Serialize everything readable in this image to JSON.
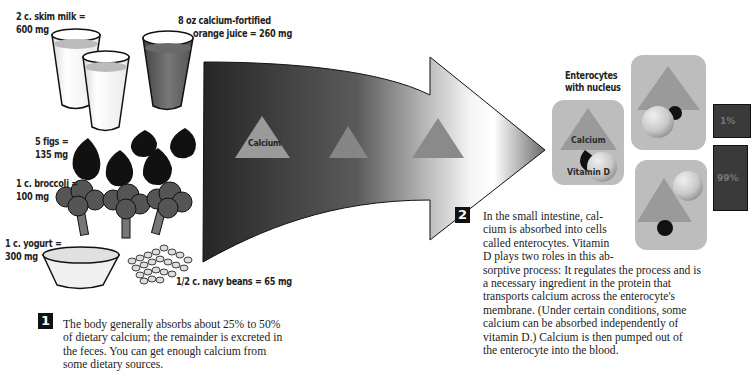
{
  "sources": {
    "milk": "2 c. skim milk =",
    "milk_mg": "600 mg",
    "oj_line1": "8 oz calcium-fortified",
    "oj_line2": "orange juice = 260 mg",
    "figs": "5 figs =",
    "figs_mg": "135 mg",
    "broccoli": "1 c. broccoli =",
    "broccoli_mg": "100 mg",
    "yogurt": "1 c. yogurt =",
    "yogurt_mg": "300 mg",
    "beans": "1/2 c. navy beans = 65 mg"
  },
  "arrow": {
    "calcium_label": "Calcium"
  },
  "enterocytes": {
    "title_line1": "Enterocytes",
    "title_line2": "with nucleus",
    "calcium_label": "Calcium",
    "vitamin_label": "Vitamin D"
  },
  "percents": {
    "top": "1%",
    "bottom": "99%"
  },
  "step1": {
    "number": "1",
    "text": "The body generally absorbs about 25% to 50% of dietary calcium; the remainder is excreted in the feces. You can get enough calcium from some dietary sources."
  },
  "step2": {
    "number": "2",
    "lines": [
      "In the small intestine, cal-",
      "cium is absorbed into cells",
      "called enterocytes. Vitamin",
      "D plays two roles in this ab-",
      "sorptive process: It regulates the process and is",
      "a necessary ingredient in the protein that",
      "transports calcium across the enterocyte's",
      "membrane. (Under certain conditions, some",
      "calcium can be absorbed independently of",
      "vitamin D.) Calcium is then pumped out of",
      "the enterocyte into the blood."
    ]
  },
  "colors": {
    "arrow_dark": "#2a2a2a",
    "arrow_light": "#ffffff",
    "triangle": "#9a9a9a",
    "cell": "#bdbdbd"
  }
}
